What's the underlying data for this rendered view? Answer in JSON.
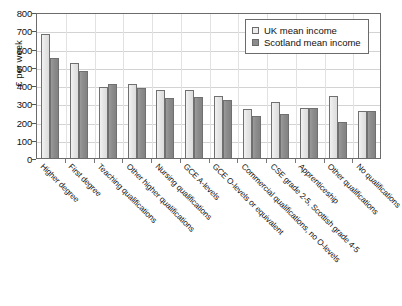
{
  "chart_data": {
    "type": "bar",
    "title": "",
    "xlabel": "",
    "ylabel": "£ per week",
    "ylim": [
      0,
      800
    ],
    "ytick_labels": [
      "800",
      "700",
      "600",
      "500",
      "400",
      "300",
      "200",
      "100",
      "0"
    ],
    "ytick_values": [
      800,
      700,
      600,
      500,
      400,
      300,
      200,
      100,
      0
    ],
    "grid": true,
    "legend_position": "top-right",
    "categories": [
      "Higher degree",
      "First degree",
      "Teaching qualifications",
      "Other higher qualifications",
      "Nursing qualifications",
      "GCE A-levels",
      "GCE O-levels or equivalent",
      "Commercial qualifications, no O-levels",
      "CSE grade 2-5, Scottish grade 4-5",
      "Apprenticeship",
      "Other qualifications",
      "No qualifications"
    ],
    "series": [
      {
        "name": "UK mean income",
        "color": "#ececec",
        "values": [
          685,
          527,
          397,
          412,
          378,
          376,
          345,
          272,
          310,
          278,
          346,
          261
        ]
      },
      {
        "name": "Scotland mean income",
        "color": "#8c8c8c",
        "values": [
          555,
          480,
          412,
          389,
          332,
          340,
          321,
          234,
          244,
          278,
          204,
          263
        ]
      }
    ]
  },
  "legend": {
    "items": [
      {
        "label": "UK mean income",
        "swatch": "light-gray-square"
      },
      {
        "label": "Scotland mean income",
        "swatch": "dark-gray-square"
      }
    ]
  }
}
